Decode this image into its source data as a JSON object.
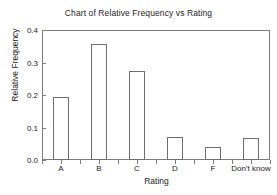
{
  "chart_data": {
    "type": "bar",
    "title": "Chart of Relative Frequency vs Rating",
    "xlabel": "Rating",
    "ylabel": "Relative Frequency",
    "categories": [
      "A",
      "B",
      "C",
      "D",
      "F",
      "Don't know"
    ],
    "values": [
      0.193,
      0.357,
      0.273,
      0.071,
      0.039,
      0.068
    ],
    "ylim": [
      0.0,
      0.4
    ],
    "ytick_labels": [
      "0.0",
      "0.1",
      "0.2",
      "0.3",
      "0.4"
    ],
    "ytick_values": [
      0.0,
      0.1,
      0.2,
      0.3,
      0.4
    ],
    "grid": false,
    "legend": null,
    "bar_fill": "#ffffff",
    "bar_outline": "#6e6e6e",
    "axis_color": "#7c7c7c",
    "background": "#ffffff"
  }
}
